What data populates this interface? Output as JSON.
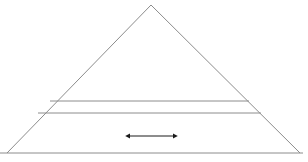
{
  "figure": {
    "title": "",
    "caption": "",
    "background_color": "#ffffff",
    "width": 308,
    "height": 162
  },
  "chart_data": {
    "type": "diagram",
    "subtype": "stratified-triangle-cross-section",
    "title": "",
    "xlabel": "",
    "ylabel": "",
    "grid": false,
    "legend": null,
    "annotations": [],
    "shapes": [
      {
        "name": "triangle-outline",
        "kind": "polyline",
        "points": [
          [
            7,
            153
          ],
          [
            151,
            5
          ],
          [
            300,
            153
          ]
        ],
        "closed": false,
        "stroke": "#8c8c8c",
        "stroke_width": 1,
        "fill": "none"
      },
      {
        "name": "baseline",
        "kind": "line",
        "points": [
          [
            0,
            153
          ],
          [
            303,
            153
          ]
        ],
        "stroke": "#8c8c8c",
        "stroke_width": 1
      },
      {
        "name": "upper-stratum-line",
        "kind": "line",
        "points": [
          [
            50,
            101
          ],
          [
            249,
            101
          ]
        ],
        "stroke": "#8c8c8c",
        "stroke_width": 1
      },
      {
        "name": "lower-stratum-line",
        "kind": "line",
        "points": [
          [
            38,
            113
          ],
          [
            261,
            113
          ]
        ],
        "stroke": "#8c8c8c",
        "stroke_width": 1
      },
      {
        "name": "double-headed-arrow",
        "kind": "double-arrow",
        "points": [
          [
            130,
            136
          ],
          [
            173,
            136
          ]
        ],
        "stroke": "#1a1a1a",
        "stroke_width": 1,
        "arrow_head_length": 5,
        "arrow_head_width": 5
      }
    ],
    "colors": {
      "outline": "#8c8c8c",
      "stratum_line": "#8c8c8c",
      "arrow": "#1a1a1a",
      "background": "#ffffff"
    }
  }
}
